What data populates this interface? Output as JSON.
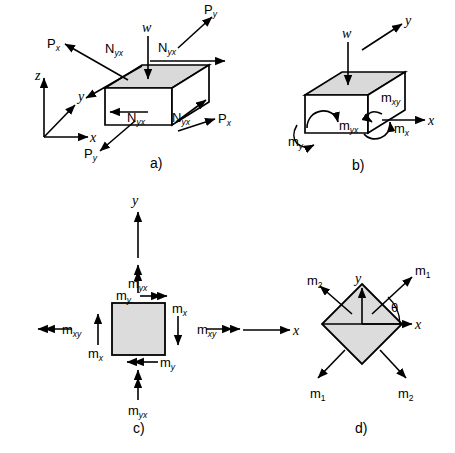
{
  "figure": {
    "background_color": "#ffffff",
    "line_color": "#000000",
    "shaded_face_color": "#d9d9d9",
    "plate_fill_color": "#dcdcdc"
  },
  "panels": [
    {
      "tag": "a)",
      "description": "Three-dimensional plate element with in-plane normal and shear forces",
      "axes": {
        "z": "z",
        "y": "y",
        "x": "x"
      },
      "load": "w",
      "labels": {
        "p_x_left": {
          "base": "P",
          "sub": "x"
        },
        "p_y_top": {
          "base": "P",
          "sub": "y"
        },
        "p_x_right": {
          "base": "P",
          "sub": "x"
        },
        "p_y_bottom": {
          "base": "P",
          "sub": "y"
        },
        "n_yx_back_left": {
          "base": "N",
          "sub": "yx"
        },
        "n_yx_back_right": {
          "base": "N",
          "sub": "yx"
        },
        "n_yx_front_left": {
          "base": "N",
          "sub": "yx"
        },
        "n_yx_front_right": {
          "base": "N",
          "sub": "yx"
        }
      }
    },
    {
      "tag": "b)",
      "description": "Three-dimensional plate element with bending and twisting moments",
      "axes": {
        "y": "y",
        "x": "x"
      },
      "load": "w",
      "labels": {
        "m_y": {
          "base": "m",
          "sub": "y"
        },
        "m_yx": {
          "base": "m",
          "sub": "yx"
        },
        "m_xy": {
          "base": "m",
          "sub": "xy"
        },
        "m_x": {
          "base": "m",
          "sub": "x"
        }
      }
    },
    {
      "tag": "c)",
      "description": "Plan view of square plate element showing moment components",
      "axes": {
        "y": "y",
        "x": "x"
      },
      "labels": {
        "m_yx_top": {
          "base": "m",
          "sub": "yx"
        },
        "m_y_top": {
          "base": "m",
          "sub": "y"
        },
        "m_xy_left": {
          "base": "m",
          "sub": "xy"
        },
        "m_x_left": {
          "base": "m",
          "sub": "x"
        },
        "m_x_right": {
          "base": "m",
          "sub": "x"
        },
        "m_xy_right": {
          "base": "m",
          "sub": "xy"
        },
        "m_y_bottom": {
          "base": "m",
          "sub": "y"
        },
        "m_yx_bottom": {
          "base": "m",
          "sub": "yx"
        }
      }
    },
    {
      "tag": "d)",
      "description": "Rotated element showing principal moments at angle theta",
      "axes": {
        "y": "y",
        "x": "x"
      },
      "angle_symbol": "θ",
      "labels": {
        "m1_upper_right": {
          "base": "m",
          "sub": "1"
        },
        "m2_upper_left": {
          "base": "m",
          "sub": "2"
        },
        "m1_lower_left": {
          "base": "m",
          "sub": "1"
        },
        "m2_lower_right": {
          "base": "m",
          "sub": "2"
        }
      }
    }
  ]
}
